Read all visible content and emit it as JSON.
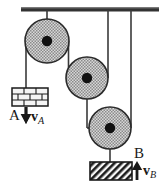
{
  "figure": {
    "type": "physics-diagram",
    "width": 167,
    "height": 186,
    "colors": {
      "ink": "#1a1a1a",
      "ceiling": "#333333",
      "pulley_fill": "#c9c9c9",
      "pulley_rim": "#2b2b2b",
      "hub": "#111111",
      "rope": "#3a3a3a",
      "block_a_fill": "#f2f2f2",
      "block_b_fill": "#e8e8e8",
      "background": "#ffffff"
    }
  },
  "ceiling": {
    "name": "support-bar",
    "x1": 21,
    "x2": 159,
    "y": 9,
    "thickness": 4
  },
  "pulleys": [
    {
      "id": "pulley-1",
      "label": "top-left pulley",
      "cx": 47,
      "cy": 41,
      "r": 22,
      "hub_r": 5
    },
    {
      "id": "pulley-2",
      "label": "middle pulley",
      "cx": 87,
      "cy": 78,
      "r": 21,
      "hub_r": 5
    },
    {
      "id": "pulley-3",
      "label": "lower pulley",
      "cx": 110,
      "cy": 128,
      "r": 21,
      "hub_r": 5
    }
  ],
  "ropes": [
    {
      "id": "rope-ceiling-to-pulley1",
      "from": "ceiling",
      "to": "pulley-1 hub",
      "x1": 47,
      "y1": 11,
      "x2": 47,
      "y2": 41
    },
    {
      "id": "rope-pulley1-left-to-block-a",
      "from": "pulley-1 left rim",
      "to": "block A",
      "x1": 26,
      "y1": 41,
      "x2": 26,
      "y2": 88
    },
    {
      "id": "rope-pulley1-right-to-pulley2",
      "from": "pulley-1 right rim",
      "to": "pulley-2 hub",
      "x1": 68,
      "y1": 41,
      "x2": 68,
      "y2": 78
    },
    {
      "id": "rope-pulley2-hub-horizontal",
      "from": "pulley-2 left rim",
      "to": "pulley-2 hub",
      "x1": 68,
      "y1": 78,
      "x2": 87,
      "y2": 78
    },
    {
      "id": "rope-pulley2-right-to-ceiling",
      "from": "pulley-2 right rim",
      "to": "ceiling",
      "x1": 108,
      "y1": 78,
      "x2": 108,
      "y2": 11
    },
    {
      "id": "rope-pulley2-hub-to-pulley3",
      "from": "pulley-2 hub",
      "to": "pulley-3 hub",
      "x1": 87,
      "y1": 78,
      "x2": 87,
      "y2": 128
    },
    {
      "id": "rope-pulley3-hub-horizontal",
      "from": "pulley-3 left rim",
      "to": "pulley-3 hub",
      "x1": 87,
      "y1": 128,
      "x2": 110,
      "y2": 128
    },
    {
      "id": "rope-pulley3-right-to-ceiling",
      "from": "pulley-3 right rim",
      "to": "ceiling",
      "x1": 131,
      "y1": 128,
      "x2": 131,
      "y2": 11
    },
    {
      "id": "rope-pulley3-hub-to-block-b",
      "from": "pulley-3 hub",
      "to": "block B",
      "x1": 110,
      "y1": 128,
      "x2": 110,
      "y2": 162
    }
  ],
  "blocks": [
    {
      "id": "block-a",
      "label": "A",
      "pattern": "brick",
      "x": 12,
      "y": 88,
      "w": 36,
      "h": 18
    },
    {
      "id": "block-b",
      "label": "B",
      "pattern": "diagonal-hatch",
      "x": 90,
      "y": 162,
      "w": 42,
      "h": 18
    }
  ],
  "velocity_arrows": [
    {
      "id": "velocity-a",
      "direction": "down",
      "symbol": "v",
      "subscript": "A",
      "block_label": "A",
      "x": 26,
      "y_tail": 108,
      "y_head": 123
    },
    {
      "id": "velocity-b",
      "direction": "up",
      "symbol": "v",
      "subscript": "B",
      "block_label": "B",
      "x": 137,
      "y_tail": 180,
      "y_head": 163
    }
  ],
  "labels": {
    "block_a": "A",
    "block_b": "B",
    "velocity_a_symbol": "v",
    "velocity_a_subscript": "A",
    "velocity_b_symbol": "v",
    "velocity_b_subscript": "B"
  }
}
